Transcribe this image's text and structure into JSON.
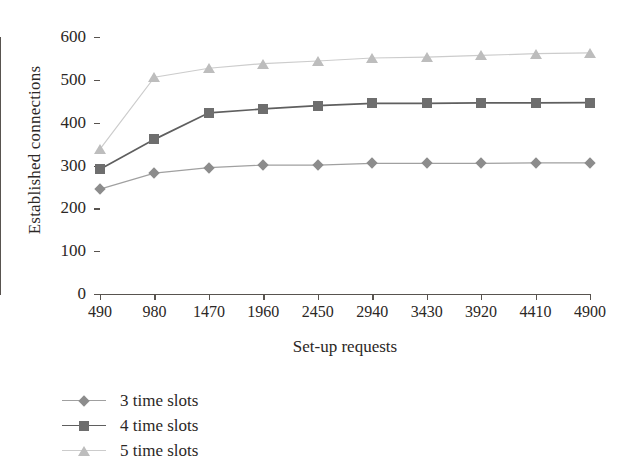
{
  "chart_data": {
    "type": "line",
    "title": "",
    "xlabel": "Set-up requests",
    "ylabel": "Established connections",
    "categories": [
      490,
      980,
      1470,
      1960,
      2450,
      2940,
      3430,
      3920,
      4410,
      4900
    ],
    "x_tick_labels": [
      "490",
      "980",
      "1470",
      "1960",
      "2450",
      "2940",
      "3430",
      "3920",
      "4410",
      "4900"
    ],
    "y_tick_labels": [
      "0",
      "100",
      "200",
      "300",
      "400",
      "500",
      "600"
    ],
    "y_ticks": [
      0,
      100,
      200,
      300,
      400,
      500,
      600
    ],
    "ylim": [
      0,
      600
    ],
    "xlim": [
      490,
      4900
    ],
    "grid": false,
    "legend_position": "below-left",
    "series": [
      {
        "name": "3 time slots",
        "marker": "diamond",
        "color": "#8c8c8c",
        "line_color": "#a0a0a0",
        "values": [
          245,
          282,
          295,
          301,
          301,
          305,
          305,
          305,
          306,
          306
        ]
      },
      {
        "name": "4 time slots",
        "marker": "square",
        "color": "#6e6e6e",
        "line_color": "#5f5f5f",
        "values": [
          291,
          361,
          423,
          432,
          440,
          445,
          445,
          446,
          446,
          447
        ]
      },
      {
        "name": "5 time slots",
        "marker": "triangle",
        "color": "#bdbdbd",
        "line_color": "#cccccc",
        "values": [
          338,
          506,
          527,
          538,
          544,
          551,
          553,
          557,
          561,
          563
        ]
      }
    ]
  },
  "legend": {
    "items": [
      {
        "label": "3 time slots"
      },
      {
        "label": "4 time slots"
      },
      {
        "label": "5 time slots"
      }
    ]
  },
  "axes": {
    "x_title": "Set-up requests",
    "y_title": "Established connections"
  },
  "colors": {
    "axis": "#58534f",
    "text": "#2b2725",
    "series_3": "#8c8c8c",
    "series_4": "#6e6e6e",
    "series_5": "#bdbdbd",
    "background": "#ffffff"
  }
}
